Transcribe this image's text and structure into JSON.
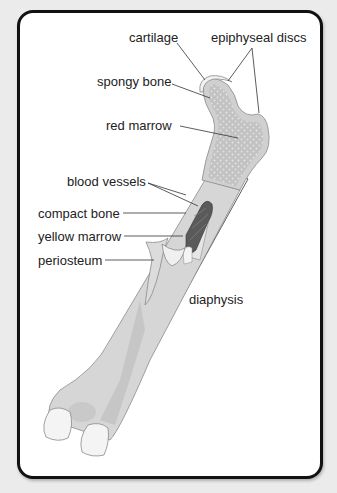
{
  "diagram": {
    "labels": {
      "cartilage": "cartilage",
      "epiphyseal_discs": "epiphyseal discs",
      "spongy_bone": "spongy bone",
      "red_marrow": "red marrow",
      "blood_vessels": "blood vessels",
      "compact_bone": "compact bone",
      "yellow_marrow": "yellow marrow",
      "periosteum": "periosteum",
      "diaphysis": "diaphysis"
    },
    "colors": {
      "background": "#ebebeb",
      "card": "#ffffff",
      "border": "#111111",
      "bone_outer": "#d6d6d6",
      "bone_inner": "#c4c4c4",
      "spongy": "#bdbdbd",
      "blood_vessels": "#555555",
      "cartilage": "#f2f2f2"
    }
  }
}
